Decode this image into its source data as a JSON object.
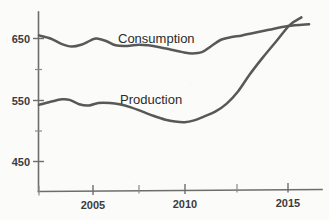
{
  "chart_data": {
    "type": "line",
    "title": "",
    "subtitle": "",
    "xlabel": "",
    "ylabel": "",
    "xlim": [
      2002,
      2016.2
    ],
    "ylim": [
      400,
      700
    ],
    "grid": false,
    "legend_position": "inline-annotation",
    "x_ticks_major": [
      2005,
      2010,
      2015
    ],
    "x_tick_labels": [
      "2005",
      "2010",
      "2015"
    ],
    "x_ticks_minor": [
      2002.5,
      2007.5,
      2012.5
    ],
    "y_ticks_major": [
      450,
      550,
      650
    ],
    "y_tick_labels": [
      "450",
      "550",
      "650"
    ],
    "y_ticks_minor": [
      500,
      600
    ],
    "annotations": [
      {
        "text": "Consumption",
        "x": 2008.0,
        "y": 655
      },
      {
        "text": "Production",
        "x": 2008.1,
        "y": 553
      }
    ],
    "series": [
      {
        "name": "Consumption",
        "color": "#585858",
        "x": [
          2002.0,
          2002.6,
          2003.2,
          2003.7,
          2004.2,
          2004.7,
          2005.0,
          2005.5,
          2006.0,
          2006.6,
          2007.2,
          2007.7,
          2008.3,
          2008.9,
          2009.5,
          2010.0,
          2010.5,
          2011.0,
          2011.5,
          2012.0,
          2012.6,
          2013.2,
          2014.0,
          2015.0,
          2016.1
        ],
        "values": [
          655,
          650,
          641,
          637,
          640,
          647,
          650,
          646,
          639,
          638,
          640,
          639,
          636,
          632,
          628,
          626,
          628,
          638,
          648,
          652,
          655,
          659,
          664,
          670,
          673
        ]
      },
      {
        "name": "Production",
        "color": "#585858",
        "x": [
          2002.0,
          2002.6,
          2003.2,
          2003.6,
          2004.1,
          2004.6,
          2005.1,
          2005.7,
          2006.2,
          2006.8,
          2007.4,
          2008.0,
          2008.6,
          2009.1,
          2009.6,
          2010.1,
          2010.6,
          2011.2,
          2011.8,
          2012.4,
          2013.0,
          2013.7,
          2014.4,
          2015.1,
          2015.7
        ],
        "values": [
          543,
          548,
          552,
          551,
          544,
          542,
          546,
          546,
          544,
          539,
          532,
          525,
          519,
          516,
          515,
          518,
          524,
          532,
          545,
          565,
          592,
          620,
          646,
          672,
          684
        ]
      }
    ]
  },
  "labels": {
    "consumption": "Consumption",
    "production": "Production",
    "y_650": "650",
    "y_550": "550",
    "y_450": "450",
    "x_2005": "2005",
    "x_2010": "2010",
    "x_2015": "2015"
  },
  "colors": {
    "line": "#585858",
    "axis": "#6d6d6d",
    "text": "#2b2b2b",
    "background": "#fbfbfa"
  }
}
